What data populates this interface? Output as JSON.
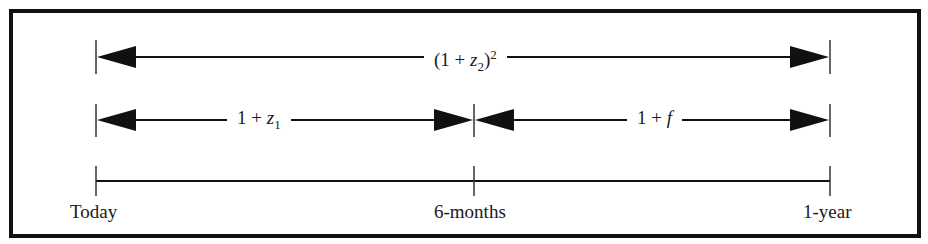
{
  "diagram": {
    "type": "timeline-rates",
    "rows": [
      {
        "id": "two-period-spot",
        "from": "Today",
        "to": "1-year",
        "label": {
          "prefix": "(1 + ",
          "var": "z",
          "sub": "2",
          "suffix": ")",
          "sup": "2"
        }
      },
      {
        "id": "first-period-spot",
        "from": "Today",
        "to": "6-months",
        "label": {
          "prefix": "1 + ",
          "var": "z",
          "sub": "1",
          "suffix": "",
          "sup": ""
        }
      },
      {
        "id": "forward-rate",
        "from": "6-months",
        "to": "1-year",
        "label": {
          "prefix": "1 + ",
          "var": "f",
          "sub": "",
          "suffix": "",
          "sup": ""
        }
      }
    ],
    "timeline": {
      "points": [
        {
          "label": "Today",
          "x": 96
        },
        {
          "label": "6-months",
          "x": 474
        },
        {
          "label": "1-year",
          "x": 830
        }
      ]
    },
    "colors": {
      "line": "#111111",
      "text": "#1a1a1a",
      "border": "#111111",
      "background": "#ffffff"
    }
  }
}
